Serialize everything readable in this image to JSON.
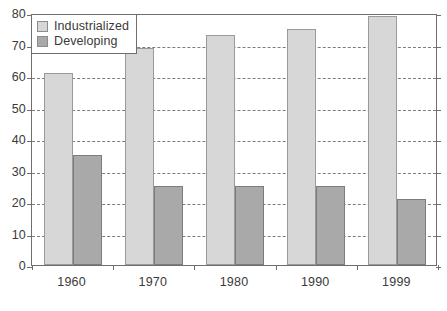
{
  "chart_data": {
    "type": "bar",
    "title": "",
    "subtitle": "",
    "xlabel": "",
    "ylabel": "",
    "categories": [
      "1960",
      "1970",
      "1980",
      "1990",
      "1999"
    ],
    "series": [
      {
        "name": "Industrialized",
        "color": "#d7d7d7",
        "values": [
          61,
          69,
          73,
          75,
          79
        ]
      },
      {
        "name": "Developing",
        "color": "#a9a9a9",
        "values": [
          35,
          25,
          25,
          25,
          21
        ]
      }
    ],
    "ylim": [
      0,
      80
    ],
    "ytick_values": [
      0,
      10,
      20,
      30,
      40,
      50,
      60,
      70,
      80
    ],
    "ytick_labels": [
      "0",
      "10",
      "20",
      "30",
      "40",
      "50",
      "60",
      "70",
      "80"
    ],
    "grid": true,
    "grid_style": "dashed",
    "grid_axis": "y",
    "legend_position": "top-left",
    "annotations": []
  }
}
